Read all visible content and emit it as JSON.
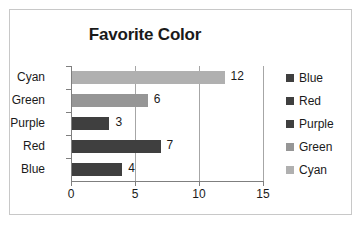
{
  "chart_data": {
    "type": "bar",
    "orientation": "horizontal",
    "title": "Favorite Color",
    "xlabel": "",
    "ylabel": "",
    "categories": [
      "Blue",
      "Red",
      "Purple",
      "Green",
      "Cyan"
    ],
    "values": [
      4,
      7,
      3,
      6,
      12
    ],
    "data_labels": [
      "4",
      "7",
      "3",
      "6",
      "12"
    ],
    "bar_colors": [
      "#3f3f3f",
      "#3f3f3f",
      "#3f3f3f",
      "#969696",
      "#b0b0b0"
    ],
    "xlim": [
      0,
      15
    ],
    "xticks": [
      0,
      5,
      10,
      15
    ],
    "xtick_labels": [
      "0",
      "5",
      "10",
      "15"
    ],
    "grid": true,
    "grid_axis": "x",
    "legend_position": "right",
    "legend": [
      {
        "label": "Blue",
        "color": "#3f3f3f"
      },
      {
        "label": "Red",
        "color": "#3f3f3f"
      },
      {
        "label": "Purple",
        "color": "#3f3f3f"
      },
      {
        "label": "Green",
        "color": "#969696"
      },
      {
        "label": "Cyan",
        "color": "#b0b0b0"
      }
    ],
    "axis_order_top_to_bottom": [
      "Cyan",
      "Green",
      "Purple",
      "Red",
      "Blue"
    ]
  }
}
